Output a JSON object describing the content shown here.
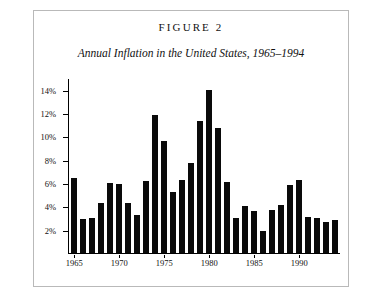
{
  "figure": {
    "label": "FIGURE 2",
    "subtitle": "Annual Inflation in the United States, 1965–1994"
  },
  "chart_data": {
    "type": "bar",
    "title": "FIGURE 2",
    "subtitle": "Annual Inflation in the United States, 1965–1994",
    "xlabel": "",
    "ylabel": "",
    "ylim": [
      0,
      15
    ],
    "grid": false,
    "legend": null,
    "bar_color": "#0a0a0a",
    "y_tick_labels": [
      "2%",
      "4%",
      "6%",
      "8%",
      "10%",
      "12%",
      "14%"
    ],
    "y_tick_values": [
      2,
      4,
      6,
      8,
      10,
      12,
      14
    ],
    "x_tick_labels": [
      "1965",
      "1970",
      "1975",
      "1980",
      "1985",
      "1990"
    ],
    "x_tick_values": [
      1965,
      1970,
      1975,
      1980,
      1985,
      1990
    ],
    "categories": [
      "1965",
      "1966",
      "1967",
      "1968",
      "1969",
      "1970",
      "1971",
      "1972",
      "1973",
      "1974",
      "1975",
      "1976",
      "1977",
      "1978",
      "1979",
      "1980",
      "1981",
      "1982",
      "1983",
      "1984",
      "1985",
      "1986",
      "1987",
      "1988",
      "1989",
      "1990",
      "1991",
      "1992",
      "1993",
      "1994"
    ],
    "values": [
      6.4,
      2.9,
      3.0,
      4.3,
      6.0,
      5.9,
      4.3,
      3.3,
      6.2,
      11.8,
      9.6,
      5.2,
      6.3,
      7.7,
      11.3,
      14.0,
      10.7,
      6.1,
      3.0,
      4.0,
      3.6,
      1.9,
      3.7,
      4.1,
      5.8,
      6.3,
      3.1,
      3.0,
      2.7,
      2.8
    ]
  }
}
